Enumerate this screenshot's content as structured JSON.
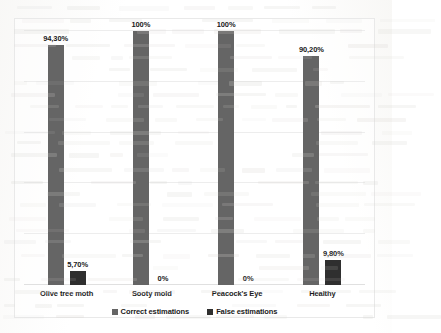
{
  "chart_data": {
    "type": "bar",
    "title": "",
    "xlabel": "",
    "ylabel": "",
    "ylim": [
      0,
      100
    ],
    "grid": true,
    "legend_position": "bottom",
    "categories": [
      "Olive tree moth",
      "Sooty mold",
      "Peacock's Eye",
      "Healthy"
    ],
    "series": [
      {
        "name": "Correct estimations",
        "color": "#656565",
        "values": [
          94.3,
          100,
          100,
          90.2
        ],
        "labels": [
          "94,30%",
          "100%",
          "100%",
          "90,20%"
        ]
      },
      {
        "name": "False estimations",
        "color": "#2f2f2f",
        "values": [
          5.7,
          0,
          0,
          9.8
        ],
        "labels": [
          "5,70%",
          "0%",
          "0%",
          "9,80%"
        ]
      }
    ],
    "gridline_values": [
      0,
      20,
      40,
      60,
      80,
      100
    ]
  },
  "legend": {
    "items": [
      {
        "label": "Correct estimations"
      },
      {
        "label": "False estimations"
      }
    ]
  }
}
